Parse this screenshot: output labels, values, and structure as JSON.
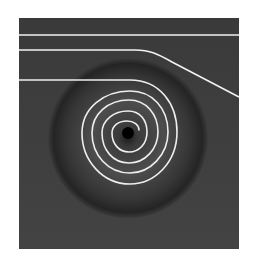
{
  "figure": {
    "colors": {
      "background": "#3b3b3b",
      "well_edge": "#262626",
      "well_glow": "#5a5a5a",
      "hole": "#000000",
      "path": "#f2f2f2"
    },
    "well": {
      "cx": 128,
      "cy": 138,
      "r": 80
    },
    "hole": {
      "cx": 128,
      "cy": 133,
      "r": 6
    },
    "trajectories": [
      {
        "name": "straight",
        "d": "M19 35 L239 35"
      },
      {
        "name": "deflected",
        "d": "M19 50 L135 50 C150 50 158 54 172 62 L239 97"
      },
      {
        "name": "spiral",
        "d": "M19 80 L130 80 C160 80 177 104 177 132 C177 162 155 184 130 184 C102 184 82 160 82 133 C82 108 104 91 130 91 C152 91 168 108 168 132 C168 155 150 173 130 173 C108 173 92 155 92 133 C92 114 108 100 129 100 C146 100 158 114 158 132 C158 149 145 163 129 163 C113 163 102 150 102 133 C102 120 114 111 128 111 C140 111 147 120 147 132 C147 144 139 152 129 152 C119 152 112 144 112 133 C112 126 118 121 127 121 C134 121 139 125 139 130"
      }
    ]
  }
}
